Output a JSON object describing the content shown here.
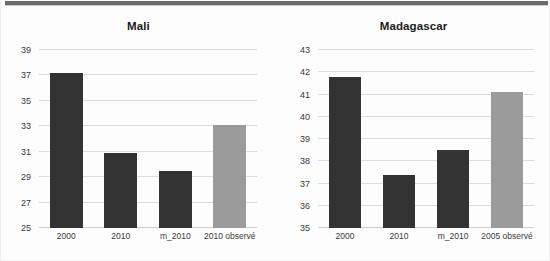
{
  "figure": {
    "background_color": "#fdfdfd",
    "top_rule_color": "#6b6b6b",
    "dark_bar_color": "#333333",
    "light_bar_color": "#9b9b9b",
    "gridline_color": "#dcdcdc"
  },
  "chart_data": [
    {
      "type": "bar",
      "title": "Mali",
      "xlabel": "",
      "ylabel": "",
      "categories": [
        "2000",
        "2010",
        "m_2010",
        "2010 observé"
      ],
      "values": [
        37.2,
        30.9,
        29.5,
        33.1
      ],
      "bar_colors": [
        "#333333",
        "#333333",
        "#333333",
        "#9b9b9b"
      ],
      "ylim": [
        25,
        39
      ],
      "yticks": [
        25,
        27,
        29,
        31,
        33,
        35,
        37,
        39
      ],
      "ytick_labels": [
        "25",
        "27",
        "29",
        "31",
        "33",
        "35",
        "37",
        "39"
      ],
      "grid": true,
      "legend": null
    },
    {
      "type": "bar",
      "title": "Madagascar",
      "xlabel": "",
      "ylabel": "",
      "categories": [
        "2000",
        "2010",
        "m_2010",
        "2005 observé"
      ],
      "values": [
        41.8,
        37.4,
        38.5,
        41.1
      ],
      "bar_colors": [
        "#333333",
        "#333333",
        "#333333",
        "#9b9b9b"
      ],
      "ylim": [
        35,
        43
      ],
      "yticks": [
        35,
        36,
        37,
        38,
        39,
        40,
        41,
        42,
        43
      ],
      "ytick_labels": [
        "35",
        "36",
        "37",
        "38",
        "39",
        "40",
        "41",
        "42",
        "43"
      ],
      "grid": true,
      "legend": null
    }
  ]
}
